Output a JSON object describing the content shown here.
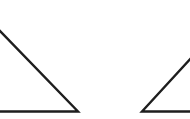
{
  "diagram": {
    "background": "#ffffff",
    "stroke_color": "#1e1e1e",
    "stroke_width": 2.4,
    "shapes": [
      {
        "name": "left-triangle",
        "description": "Right triangle clipped at left edge, hypotenuse descending to the right",
        "points": [
          [
            -2,
            29
          ],
          [
            78,
            111.5
          ],
          [
            -2,
            111.5
          ]
        ]
      },
      {
        "name": "right-triangle",
        "description": "Right triangle clipped at right edge, hypotenuse rising to the right",
        "points": [
          [
            192,
            57
          ],
          [
            142,
            111.5
          ],
          [
            192,
            111.5
          ]
        ]
      }
    ]
  }
}
